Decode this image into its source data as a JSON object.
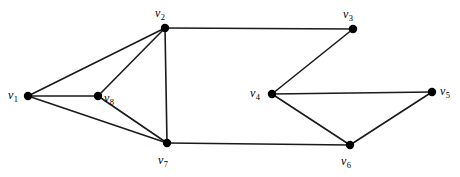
{
  "figure": {
    "kind": "undirected-graph-diagram",
    "width": 460,
    "height": 177,
    "background_color": "#ffffff",
    "edge_color": "#1a1a1a",
    "vertex_color": "#000000",
    "label_color": "#000000",
    "edge_width": 1.6,
    "vertex_radius": 4.2
  },
  "graph": {
    "vertex_count": 8,
    "edge_count": 12,
    "vertices": [
      {
        "id": "v1",
        "letter": "v",
        "subscript": "1",
        "x": 28,
        "y": 96,
        "label_x": 8,
        "label_y": 89,
        "label_anchor": "left"
      },
      {
        "id": "v2",
        "letter": "v",
        "subscript": "2",
        "x": 165,
        "y": 28,
        "label_x": 155,
        "label_y": 7,
        "label_anchor": "above"
      },
      {
        "id": "v3",
        "letter": "v",
        "subscript": "3",
        "x": 353,
        "y": 29,
        "label_x": 343,
        "label_y": 8,
        "label_anchor": "above"
      },
      {
        "id": "v4",
        "letter": "v",
        "subscript": "4",
        "x": 272,
        "y": 94,
        "label_x": 250,
        "label_y": 87,
        "label_anchor": "left"
      },
      {
        "id": "v5",
        "letter": "v",
        "subscript": "5",
        "x": 432,
        "y": 92,
        "label_x": 440,
        "label_y": 85,
        "label_anchor": "right"
      },
      {
        "id": "v6",
        "letter": "v",
        "subscript": "6",
        "x": 350,
        "y": 145,
        "label_x": 341,
        "label_y": 155,
        "label_anchor": "below"
      },
      {
        "id": "v7",
        "letter": "v",
        "subscript": "7",
        "x": 167,
        "y": 143,
        "label_x": 158,
        "label_y": 154,
        "label_anchor": "below"
      },
      {
        "id": "v8",
        "letter": "v",
        "subscript": "8",
        "x": 98,
        "y": 96,
        "label_x": 104,
        "label_y": 92,
        "label_anchor": "right"
      }
    ],
    "edges": [
      {
        "from": "v1",
        "to": "v2"
      },
      {
        "from": "v1",
        "to": "v8"
      },
      {
        "from": "v1",
        "to": "v7"
      },
      {
        "from": "v2",
        "to": "v8"
      },
      {
        "from": "v2",
        "to": "v7"
      },
      {
        "from": "v2",
        "to": "v3"
      },
      {
        "from": "v8",
        "to": "v7"
      },
      {
        "from": "v7",
        "to": "v6"
      },
      {
        "from": "v3",
        "to": "v4"
      },
      {
        "from": "v4",
        "to": "v5"
      },
      {
        "from": "v4",
        "to": "v6"
      },
      {
        "from": "v5",
        "to": "v6"
      }
    ]
  }
}
